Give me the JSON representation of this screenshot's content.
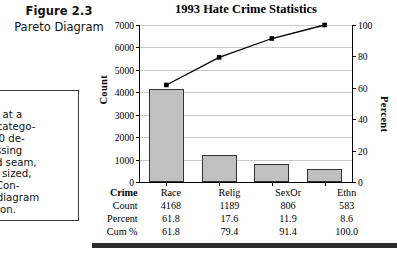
{
  "figure": {
    "label": "Figure 2.3",
    "caption": "Pareto Diagram"
  },
  "note_box": {
    "lines": [
      ".4",
      "ector at a",
      "tory catego-",
      "st 500 de-",
      "—missing",
      "—bad seam,",
      "perly sized,",
      "law. Con-",
      "reto diagram",
      "rmation."
    ]
  },
  "chart_data": {
    "type": "bar",
    "title": "1993 Hate Crime Statistics",
    "xlabel": "Crime",
    "ylabel": "Count",
    "y2label": "Percent",
    "categories": [
      "Race",
      "Relig",
      "SexOr",
      "Ethn"
    ],
    "values": [
      4168,
      1189,
      806,
      583
    ],
    "series": [
      {
        "name": "Count",
        "type": "bar",
        "values": [
          4168,
          1189,
          806,
          583
        ],
        "axis": "left"
      },
      {
        "name": "Cum %",
        "type": "line",
        "values": [
          61.8,
          79.4,
          91.4,
          100.0
        ],
        "axis": "right"
      }
    ],
    "ylim": [
      0,
      7000
    ],
    "yticks": [
      0,
      1000,
      2000,
      3000,
      4000,
      5000,
      6000,
      7000
    ],
    "y2lim": [
      0,
      100
    ],
    "y2ticks": [
      0,
      20,
      40,
      60,
      80,
      100
    ],
    "grid": true,
    "legend": "none",
    "bar_color": "#c0c0c0",
    "line_color": "#000000"
  },
  "table": {
    "rows": [
      {
        "label": "Crime",
        "values": [
          "Race",
          "Relig",
          "SexOr",
          "Ethn"
        ]
      },
      {
        "label": "Count",
        "values": [
          "4168",
          "1189",
          "806",
          "583"
        ]
      },
      {
        "label": "Percent",
        "values": [
          "61.8",
          "17.6",
          "11.9",
          "8.6"
        ]
      },
      {
        "label": "Cum %",
        "values": [
          "61.8",
          "79.4",
          "91.4",
          "100.0"
        ]
      }
    ]
  }
}
